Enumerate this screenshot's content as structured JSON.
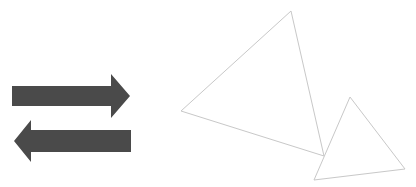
{
  "canvas": {
    "width": 416,
    "height": 187,
    "background": "#ffffff"
  },
  "colors": {
    "arrow_fill": "#4a4a4a",
    "triangle_stroke": "#c8c8c8"
  },
  "arrows": [
    {
      "name": "right-arrow",
      "direction": "right",
      "points": "12,86 111,86 111,74 130,96 111,118 111,106 12,106"
    },
    {
      "name": "left-arrow",
      "direction": "left",
      "points": "131,130 31,130 31,120 14,141 31,162 31,152 131,152"
    }
  ],
  "triangles": [
    {
      "name": "large-triangle",
      "points": "291,11 181,111 324,156"
    },
    {
      "name": "small-triangle",
      "points": "350,97 405,169 314,180"
    }
  ]
}
